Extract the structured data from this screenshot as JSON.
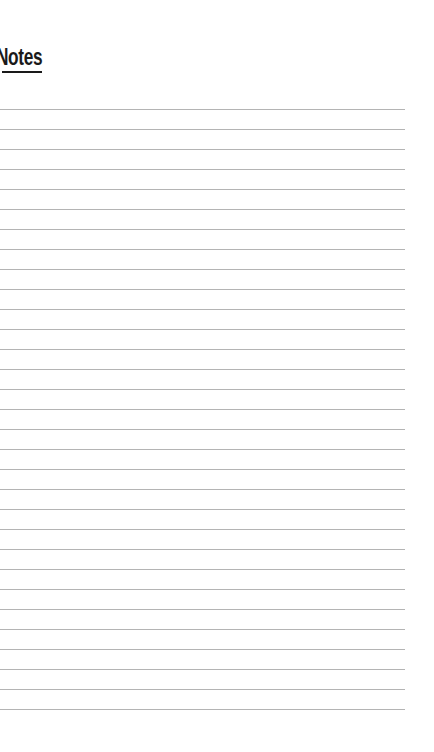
{
  "page": {
    "title": "Notes",
    "accent_color": "#1a1a1a",
    "rule_color": "#b4b4b4"
  },
  "ruled_lines": {
    "count": 31,
    "first_y": 109,
    "spacing": 20,
    "right_edge": 405
  }
}
